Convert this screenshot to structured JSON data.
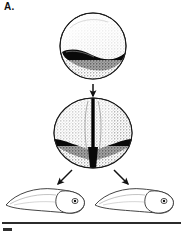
{
  "figure": {
    "panel_label": "A.",
    "title": "Normal development: grey crescent divided equally between both blastomeres",
    "background_color": "#ffffff",
    "ink_color": "#111111",
    "pigment_color": "#000000",
    "stipple_color": "#4a4a4a"
  },
  "stages": [
    {
      "id": "fertilized-egg",
      "name": "fertilized-egg",
      "label": "",
      "description": "Spherical fertilized egg with dark grey crescent band across lower hemisphere",
      "cx": 93,
      "cy": 46,
      "rx": 33,
      "ry": 33,
      "crescent": "single-horizontal-band"
    },
    {
      "id": "two-cell-embryo",
      "name": "two-cell-embryo",
      "label": "",
      "description": "Two-cell embryo, vertical cleavage furrow bisecting the grey crescent so each blastomere receives half",
      "cx": 93,
      "cy": 133,
      "rx": 39,
      "ry": 35,
      "crescent": "band-split-by-furrow"
    },
    {
      "id": "tadpole-left",
      "name": "tadpole-left",
      "label": "",
      "description": "Normal tadpole developed from left blastomere, head to the right, tapering tail to the left",
      "cx": 47,
      "cy": 200
    },
    {
      "id": "tadpole-right",
      "name": "tadpole-right",
      "label": "",
      "description": "Normal tadpole developed from right blastomere, head to the right, tapering tail to the left",
      "cx": 135,
      "cy": 200
    }
  ],
  "arrows": [
    {
      "id": "arrow-egg-to-two-cell",
      "name": "arrow-egg-to-two-cell",
      "direction": "down",
      "label": ""
    },
    {
      "id": "arrow-to-left-tadpole",
      "name": "arrow-to-left-tadpole",
      "direction": "down-left",
      "label": ""
    },
    {
      "id": "arrow-to-right-tadpole",
      "name": "arrow-to-right-tadpole",
      "direction": "down-right",
      "label": ""
    }
  ],
  "rule": {
    "name": "panel-divider-rule",
    "color": "#2b2b2b"
  },
  "next_panel": {
    "name": "next-panel-label-clipped",
    "label": ""
  }
}
